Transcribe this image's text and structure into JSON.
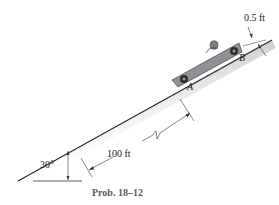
{
  "figure": {
    "caption": "Prob. 18–12",
    "labels": {
      "angle": "30°",
      "distance": "100 ft",
      "height": "0.5 ft",
      "point_a": "A",
      "point_b": "B"
    },
    "colors": {
      "incline_shade": "#c9cbcd",
      "car_body": "#8e9296",
      "wheel": "#2b2b2b",
      "line": "#222222"
    }
  }
}
